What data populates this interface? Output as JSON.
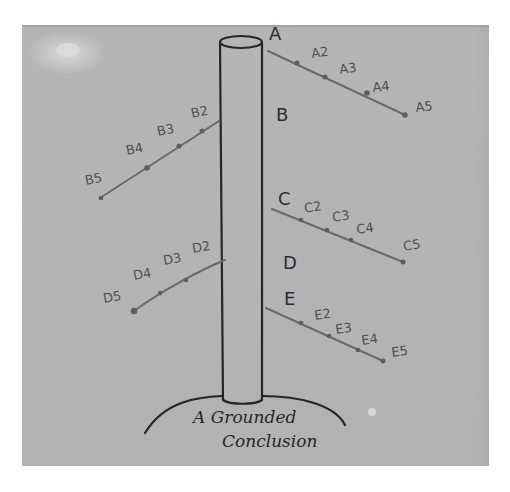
{
  "diagram": {
    "pillar_label": "",
    "branches": [
      {
        "id": "A",
        "label": "A",
        "side": "right",
        "points": [
          "A2",
          "A3",
          "A4",
          "A5"
        ]
      },
      {
        "id": "B",
        "label": "B",
        "side": "left",
        "points": [
          "B2",
          "B3",
          "B4",
          "B5"
        ]
      },
      {
        "id": "C",
        "label": "C",
        "side": "right",
        "points": [
          "C2",
          "C3",
          "C4",
          "C5"
        ]
      },
      {
        "id": "D",
        "label": "D",
        "side": "left",
        "points": [
          "D2",
          "D3",
          "D4",
          "D5"
        ]
      },
      {
        "id": "E",
        "label": "E",
        "side": "right",
        "points": [
          "E2",
          "E3",
          "E4",
          "E5"
        ]
      }
    ],
    "sub_labels_as_written": {
      "A": [
        "A2",
        "A3",
        "A4",
        "A5"
      ],
      "B": [
        "B2",
        "B3",
        "B4",
        "B5"
      ],
      "C": [
        "C2",
        "C3",
        "C4",
        "C5"
      ],
      "D": [
        "D2",
        "D3",
        "D4",
        "D5"
      ],
      "E": [
        "E2",
        "E3",
        "E4",
        "E5"
      ]
    },
    "ground_caption_line1": "A Grounded",
    "ground_caption_line2": "Conclusion",
    "colors": {
      "paper": "#b3b3b3",
      "ink_dark": "#262626",
      "ink_branch": "#6a6a6a",
      "background": "#ffffff"
    }
  }
}
